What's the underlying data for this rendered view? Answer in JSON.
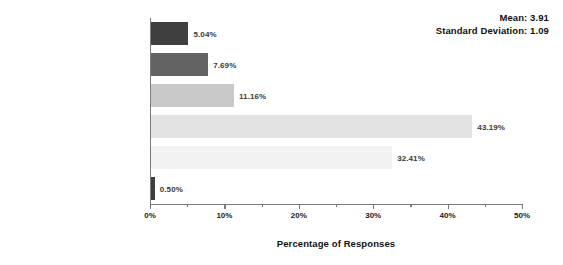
{
  "chart_data": {
    "type": "bar",
    "orientation": "horizontal",
    "title": "",
    "xlabel": "Percentage of Responses",
    "ylabel": "",
    "xlim": [
      0,
      50
    ],
    "xtick_labels": [
      "0%",
      "10%",
      "20%",
      "30%",
      "40%",
      "50%"
    ],
    "xtick_values": [
      0,
      10,
      20,
      30,
      40,
      50
    ],
    "minor_tick_step": 5,
    "grid": false,
    "legend": "none",
    "value_suffix": "%",
    "categories": [
      "Strongly Disagree",
      "Disagree",
      "Neither Agree Nor Disagree",
      "Agree",
      "Strongly Agree",
      "Prefer not to answer"
    ],
    "values": [
      5.04,
      7.69,
      11.16,
      43.19,
      32.41,
      0.5
    ],
    "value_labels": [
      "5.04%",
      "7.69%",
      "11.16%",
      "43.19%",
      "32.41%",
      "0.50%"
    ],
    "bar_colors": [
      "#3f3f3f",
      "#636363",
      "#c9c9c9",
      "#e3e3e3",
      "#f2f2f2",
      "#3f3f3f"
    ]
  },
  "annotations": {
    "mean_label": "Mean: 3.91",
    "std_label": "Standard Deviation: 1.09"
  }
}
